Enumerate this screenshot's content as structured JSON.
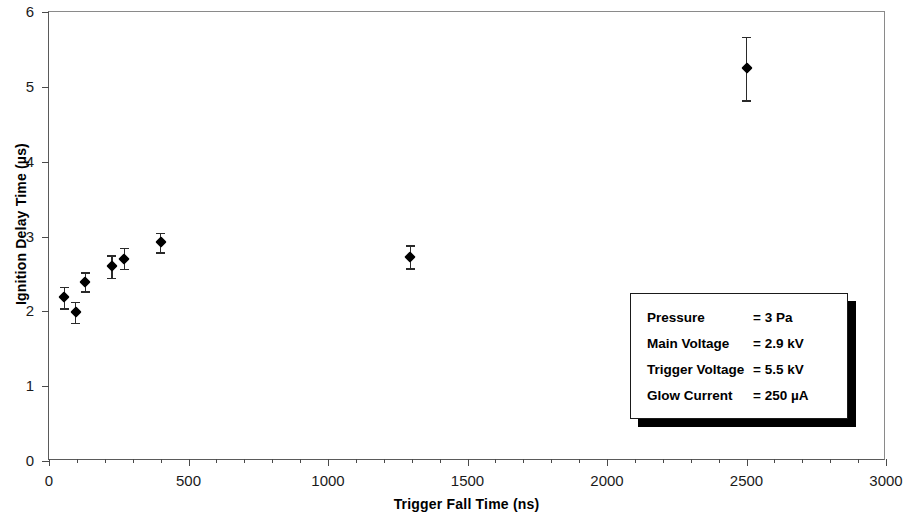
{
  "chart_data": {
    "type": "scatter",
    "title": "",
    "xlabel": "Trigger Fall Time (ns)",
    "ylabel": "Ignition Delay Time (µs)",
    "xlim": [
      0,
      3000
    ],
    "ylim": [
      0,
      6
    ],
    "x_major_ticks": [
      0,
      500,
      1000,
      1500,
      2000,
      2500,
      3000
    ],
    "x_tick_labels": [
      "0",
      "500",
      "1000",
      "1500",
      "2000",
      "2500",
      "3000"
    ],
    "x_minor_tick_step": 100,
    "y_major_ticks": [
      0,
      1,
      2,
      3,
      4,
      5,
      6
    ],
    "y_tick_labels": [
      "0",
      "1",
      "2",
      "3",
      "4",
      "5",
      "6"
    ],
    "grid": false,
    "legend_position": "inside-bottom-right",
    "marker": "filled-diamond",
    "marker_color": "#000000",
    "errorbars": "vertical",
    "points": [
      {
        "x": 55,
        "y": 2.19,
        "yerr_low": 2.04,
        "yerr_high": 2.33
      },
      {
        "x": 95,
        "y": 1.99,
        "yerr_low": 1.85,
        "yerr_high": 2.13
      },
      {
        "x": 130,
        "y": 2.39,
        "yerr_low": 2.27,
        "yerr_high": 2.52
      },
      {
        "x": 225,
        "y": 2.6,
        "yerr_low": 2.45,
        "yerr_high": 2.75
      },
      {
        "x": 270,
        "y": 2.7,
        "yerr_low": 2.57,
        "yerr_high": 2.85
      },
      {
        "x": 400,
        "y": 2.92,
        "yerr_low": 2.79,
        "yerr_high": 3.05
      },
      {
        "x": 1295,
        "y": 2.72,
        "yerr_low": 2.58,
        "yerr_high": 2.88
      },
      {
        "x": 2500,
        "y": 5.25,
        "yerr_low": 4.82,
        "yerr_high": 5.67
      }
    ]
  },
  "legend": {
    "rows": [
      {
        "key": "Pressure",
        "value": "= 3 Pa"
      },
      {
        "key": "Main Voltage",
        "value": "= 2.9 kV"
      },
      {
        "key": "Trigger Voltage",
        "value": "= 5.5 kV"
      },
      {
        "key": "Glow Current",
        "value": "= 250 µA"
      }
    ]
  }
}
